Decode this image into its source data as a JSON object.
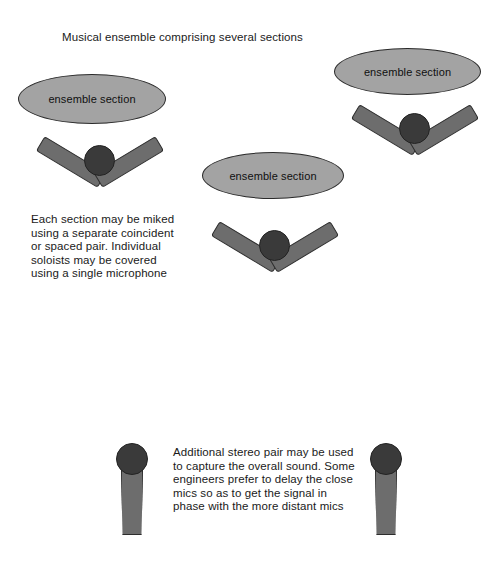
{
  "canvas": {
    "width": 491,
    "height": 562,
    "background": "#ffffff"
  },
  "palette": {
    "ellipse_fill": "#a3a3a3",
    "ellipse_stroke": "#2b2b2b",
    "mic_body_fill": "#6d6d6d",
    "mic_body_stroke": "#2d2d2d",
    "mic_head_fill": "#3a3a3a",
    "mic_head_stroke": "#232323",
    "text_color": "#1a1a1a"
  },
  "title": "Musical ensemble comprising several sections",
  "ellipses": [
    {
      "label": "ensemble section"
    },
    {
      "label": "ensemble section"
    },
    {
      "label": "ensemble section"
    }
  ],
  "notes": {
    "sections": "Each section may be miked using a separate coincident or spaced pair. Individual soloists may be covered using a single microphone",
    "stereo": "Additional stereo pair may be used to capture the overall sound. Some engineers prefer to delay the close mics so as to get the signal in phase with the more distant mics"
  },
  "mic_pairs": [
    {
      "name": "coincident-pair-left"
    },
    {
      "name": "coincident-pair-center"
    },
    {
      "name": "coincident-pair-right"
    }
  ],
  "single_mics": [
    {
      "name": "stereo-mic-left"
    },
    {
      "name": "stereo-mic-right"
    }
  ]
}
